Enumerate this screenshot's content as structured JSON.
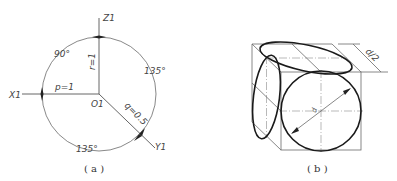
{
  "figure_a": {
    "caption": "( a )",
    "axes": {
      "z": "Z1",
      "x": "X1",
      "y": "Y1",
      "origin": "O1"
    },
    "coefficients": {
      "p": "p=1",
      "r": "r=1",
      "q": "q=0.5"
    },
    "angles": {
      "xz": "90°",
      "zy": "135°",
      "xy": "135°"
    }
  },
  "figure_b": {
    "caption": "( b )",
    "dimension_label": "d/2",
    "diameter_label": "d"
  }
}
